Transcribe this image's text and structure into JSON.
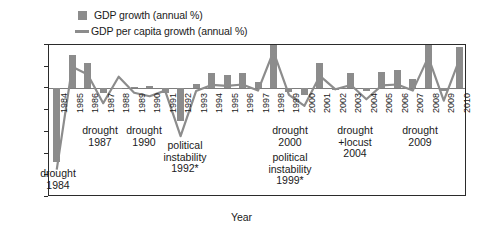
{
  "legend": {
    "items": [
      {
        "label": "GDP growth (annual %)",
        "marker": "bar-swatch",
        "color": "#8c8c8c"
      },
      {
        "label": "GDP per capita growth (annual %)",
        "marker": "line-swatch",
        "color": "#8c8c8c"
      }
    ]
  },
  "axes": {
    "y_title": "Percent",
    "x_title": "Year",
    "y_ticks": [
      "10",
      "5",
      "0",
      "-5",
      "-10",
      "-15",
      "-20",
      "-25"
    ]
  },
  "annotations": [
    {
      "id": "drought-1984",
      "lines": [
        "drought",
        "1984"
      ]
    },
    {
      "id": "drought-1987",
      "lines": [
        "drought",
        "1987"
      ]
    },
    {
      "id": "drought-1990",
      "lines": [
        "drought",
        "1990"
      ]
    },
    {
      "id": "political-instability-1992",
      "lines": [
        "political",
        "instability",
        "1992*"
      ]
    },
    {
      "id": "drought-2000",
      "lines": [
        "drought",
        "2000"
      ]
    },
    {
      "id": "political-instability-1999",
      "lines": [
        "political",
        "instability",
        "1999*"
      ]
    },
    {
      "id": "drought-locust-2004",
      "lines": [
        "drought",
        "+locust",
        "2004"
      ]
    },
    {
      "id": "drought-2009",
      "lines": [
        "drought",
        "2009"
      ]
    }
  ],
  "chart_data": {
    "type": "bar",
    "title": "",
    "xlabel": "Year",
    "ylabel": "Percent",
    "ylim": [
      -25,
      10
    ],
    "grid": false,
    "legend_position": "top-left",
    "categories": [
      "1984",
      "1985",
      "1986",
      "1987",
      "1988",
      "1989",
      "1990",
      "1991",
      "1992",
      "1993",
      "1994",
      "1995",
      "1996",
      "1997",
      "1998",
      "1999",
      "2000",
      "2001",
      "2002",
      "2003",
      "2004",
      "2005",
      "2006",
      "2007",
      "2008",
      "2009",
      "2010"
    ],
    "series": [
      {
        "name": "GDP growth (annual %)",
        "type": "bar",
        "color": "#8c8c8c",
        "values": [
          -17.0,
          7.8,
          5.8,
          -1.0,
          -0.2,
          0.4,
          0.5,
          -1.0,
          -7.5,
          1.0,
          3.5,
          3.1,
          3.5,
          1.5,
          11.5,
          -0.8,
          -1.5,
          5.8,
          -0.3,
          3.5,
          -0.5,
          3.7,
          4.2,
          2.2,
          10.5,
          -0.5,
          9.5
        ]
      },
      {
        "name": "GDP per capita growth (annual %)",
        "type": "line",
        "color": "#8c8c8c",
        "values": [
          -18.7,
          5.0,
          3.2,
          -3.4,
          2.7,
          -1.0,
          -1.8,
          -0.5,
          -11.0,
          -0.6,
          0.8,
          0.6,
          0.9,
          -0.5,
          8.5,
          -1.5,
          -4.0,
          2.9,
          -0.2,
          0.8,
          -2.5,
          0.7,
          0.9,
          -0.5,
          7.2,
          -2.8,
          6.6
        ]
      }
    ]
  }
}
